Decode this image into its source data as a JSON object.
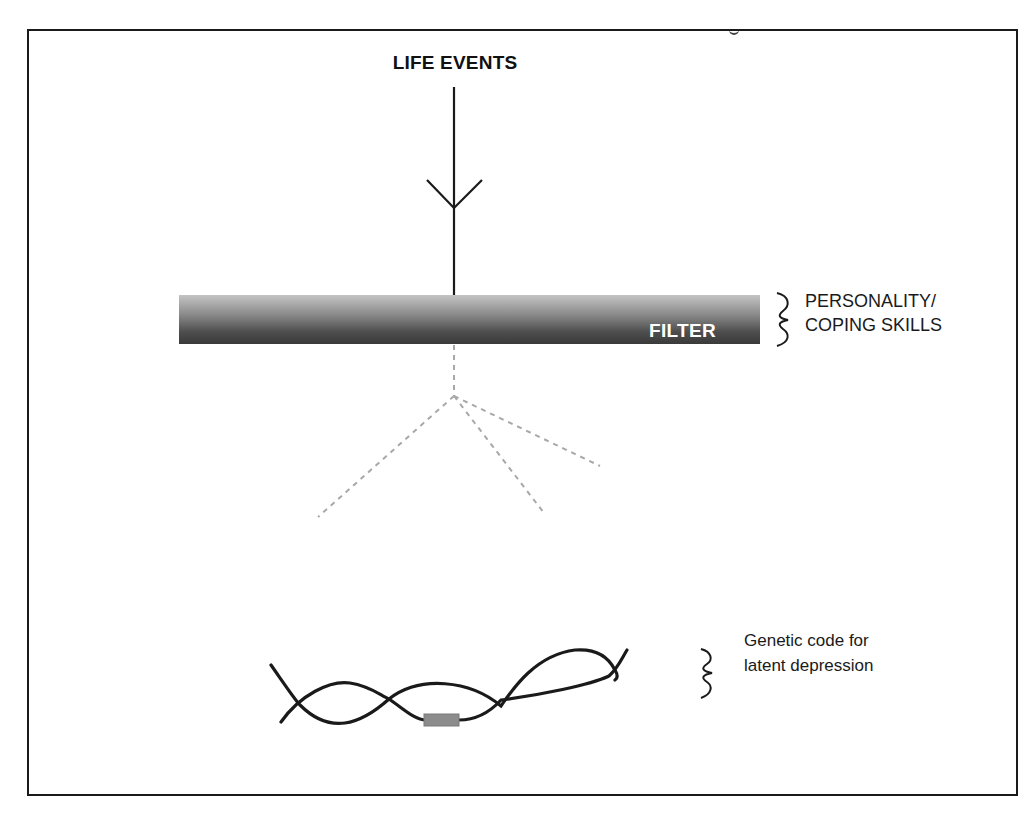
{
  "diagram": {
    "title": "LIFE EVENTS",
    "filter": {
      "label": "FILTER",
      "gradient_top": "#c4c4c4",
      "gradient_bottom": "#3a3a3a"
    },
    "filter_annotation": {
      "line1": "PERSONALITY/",
      "line2": "COPING SKILLS"
    },
    "gene_annotation": {
      "line1": "Genetic code for",
      "line2": "latent depression"
    },
    "colors": {
      "stroke": "#1a1a1a",
      "dashed": "#a8a8a8",
      "gene_marker": "#8c8c8c",
      "frame": "#1a1a1a"
    },
    "nodes": [
      {
        "id": "life-events",
        "label": "LIFE EVENTS"
      },
      {
        "id": "filter",
        "label": "FILTER"
      },
      {
        "id": "genetic-code",
        "label": "Genetic code for latent depression"
      }
    ],
    "edges": [
      {
        "from": "life-events",
        "to": "filter",
        "style": "solid-arrow"
      },
      {
        "from": "filter",
        "to": "scatter",
        "style": "dashed-branching",
        "branches": 3
      }
    ]
  }
}
